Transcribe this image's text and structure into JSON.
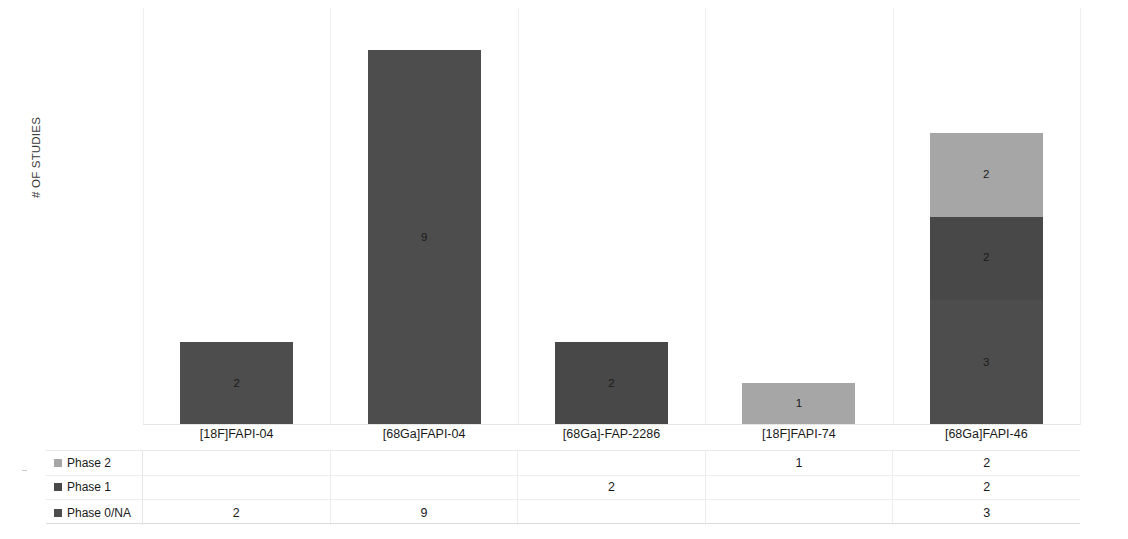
{
  "chart_data": {
    "type": "bar",
    "subtype": "stacked-column",
    "title": "",
    "xlabel": "",
    "ylabel": "# OF STUDIES",
    "ylim": [
      0,
      10
    ],
    "grid": "vertical-only",
    "legend_position": "data-table-left",
    "categories": [
      "[18F]FAPI-04",
      "[68Ga]FAPI-04",
      "[68Ga]-FAP-2286",
      "[18F]FAPI-74",
      "[68Ga]FAPI-46"
    ],
    "series": [
      {
        "name": "Phase 2",
        "color": "#a6a6a6",
        "values": [
          null,
          null,
          null,
          1,
          2
        ]
      },
      {
        "name": "Phase 1",
        "color": "#484848",
        "values": [
          null,
          null,
          2,
          null,
          2
        ]
      },
      {
        "name": "Phase 0/NA",
        "color": "#4d4d4d",
        "values": [
          2,
          9,
          null,
          null,
          3
        ]
      }
    ],
    "totals": [
      2,
      9,
      2,
      1,
      7
    ],
    "bar_labels": {
      "[18F]FAPI-04": [
        "2"
      ],
      "[68Ga]FAPI-04": [
        "9"
      ],
      "[68Ga]-FAP-2286": [
        "2"
      ],
      "[18F]FAPI-74": [
        "1"
      ],
      "[68Ga]FAPI-46": [
        "2",
        "2",
        "3"
      ]
    }
  },
  "axis": {
    "y_title": "# OF STUDIES"
  },
  "categories": [
    {
      "label": "[18F]FAPI-04"
    },
    {
      "label": "[68Ga]FAPI-04"
    },
    {
      "label": "[68Ga]-FAP-2286"
    },
    {
      "label": "[18F]FAPI-74"
    },
    {
      "label": "[68Ga]FAPI-46"
    }
  ],
  "bars": [
    {
      "category": "[18F]FAPI-04",
      "segments": [
        {
          "series": "Phase 0/NA",
          "value": 2,
          "label": "2"
        }
      ]
    },
    {
      "category": "[68Ga]FAPI-04",
      "segments": [
        {
          "series": "Phase 0/NA",
          "value": 9,
          "label": "9"
        }
      ]
    },
    {
      "category": "[68Ga]-FAP-2286",
      "segments": [
        {
          "series": "Phase 1",
          "value": 2,
          "label": "2"
        }
      ]
    },
    {
      "category": "[18F]FAPI-74",
      "segments": [
        {
          "series": "Phase 2",
          "value": 1,
          "label": "1"
        }
      ]
    },
    {
      "category": "[68Ga]FAPI-46",
      "segments": [
        {
          "series": "Phase 0/NA",
          "value": 3,
          "label": "3"
        },
        {
          "series": "Phase 1",
          "value": 2,
          "label": "2"
        },
        {
          "series": "Phase 2",
          "value": 2,
          "label": "2"
        }
      ]
    }
  ],
  "data_table": {
    "columns": [
      "[18F]FAPI-04",
      "[68Ga]FAPI-04",
      "[68Ga]-FAP-2286",
      "[18F]FAPI-74",
      "[68Ga]FAPI-46"
    ],
    "rows": [
      {
        "legend": "Phase 2",
        "color": "#a6a6a6",
        "cells": [
          "",
          "",
          "",
          "1",
          "2"
        ]
      },
      {
        "legend": "Phase 1",
        "color": "#484848",
        "cells": [
          "",
          "",
          "2",
          "",
          "2"
        ]
      },
      {
        "legend": "Phase 0/NA",
        "color": "#4d4d4d",
        "cells": [
          "2",
          "9",
          "",
          "",
          "3"
        ]
      }
    ]
  },
  "colors": {
    "phase_2": "#a6a6a6",
    "phase_1": "#484848",
    "phase_0_na": "#4d4d4d",
    "gridline": "#efefef",
    "table_border": "#e9e9e9",
    "text": "#1a1a1a"
  }
}
